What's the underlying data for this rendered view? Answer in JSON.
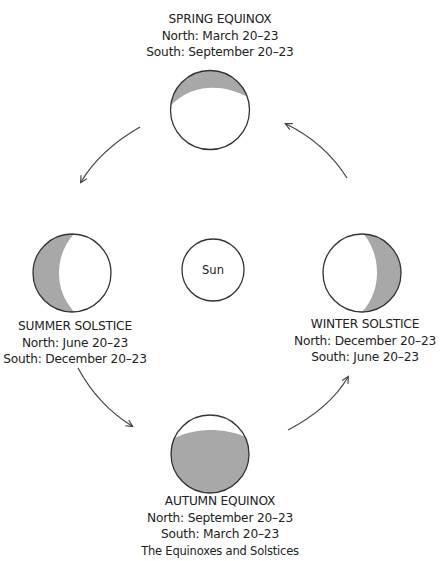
{
  "diagram": {
    "caption": "The Equinoxes and Solstices",
    "center": {
      "label": "Sun"
    },
    "colors": {
      "shade": "#a8a8a8",
      "stroke": "#333333",
      "arrow": "#444444"
    },
    "positions": {
      "spring": {
        "title": "SPRING EQUINOX",
        "north": "North: March 20–23",
        "south": "South: September 20–23",
        "shaded": "top"
      },
      "summer": {
        "title": "SUMMER SOLSTICE",
        "north": "North: June 20–23",
        "south": "South: December 20–23",
        "shaded": "left"
      },
      "winter": {
        "title": "WINTER SOLSTICE",
        "north": "North: December 20–23",
        "south": "South: June 20–23",
        "shaded": "right"
      },
      "autumn": {
        "title": "AUTUMN EQUINOX",
        "north": "North: September 20–23",
        "south": "South: March 20–23",
        "shaded": "bottom"
      }
    },
    "cycle_direction": "counterclockwise: spring → summer → autumn → winter → spring"
  }
}
